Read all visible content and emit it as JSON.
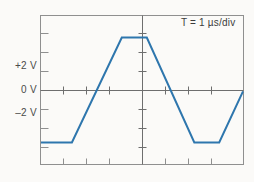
{
  "figure": {
    "background_color": "#fbfaf8",
    "frame_color": "#8c8c8c",
    "axis_color": "#6e6e6e",
    "trace_color": "#2e76ad",
    "label_color": "#4a4a4a"
  },
  "labels": {
    "y_plus2": "+2 V",
    "y_zero": "0 V",
    "y_minus2": "–2 V",
    "timebase": "T = 1 µs/div"
  },
  "chart_data": {
    "type": "line",
    "title": "",
    "subtitle": "",
    "xlabel": "",
    "ylabel": "",
    "annotations": [
      "T = 1 µs/div"
    ],
    "grid": false,
    "legend": "none",
    "x_unit": "µs",
    "y_unit": "V",
    "xlim": [
      -4.25,
      4.25
    ],
    "ylim": [
      -3.95,
      3.95
    ],
    "x_tick_interval": 1,
    "y_tick_interval": 1,
    "x_ticks": [
      -4,
      -3,
      -2,
      -1,
      0,
      1,
      2,
      3,
      4
    ],
    "y_ticks": [
      -3,
      -2,
      -1,
      0,
      1,
      2,
      3
    ],
    "y_tick_labels": [
      {
        "value": 2,
        "label": "+2 V"
      },
      {
        "value": 0,
        "label": "0 V"
      },
      {
        "value": -2,
        "label": "–2 V"
      }
    ],
    "series": [
      {
        "name": "trapezoidal-waveform",
        "color": "#2e76ad",
        "line_width": 2,
        "x": [
          -4.25,
          -2.95,
          -0.85,
          0.2,
          2.2,
          3.25,
          5.3,
          6.35,
          8.45
        ],
        "y": [
          -2.8,
          -2.8,
          2.8,
          2.8,
          -2.8,
          -2.8,
          2.8,
          2.8,
          -2.8
        ],
        "points": [
          {
            "x": -4.25,
            "y": -2.8
          },
          {
            "x": -2.95,
            "y": -2.8
          },
          {
            "x": -0.85,
            "y": 2.8
          },
          {
            "x": 0.2,
            "y": 2.8
          },
          {
            "x": 2.2,
            "y": -2.8
          },
          {
            "x": 3.25,
            "y": -2.8
          },
          {
            "x": 4.25,
            "y": 2.0
          }
        ],
        "description": "Trapezoidal wave, amplitude ±2.8 V, period 4 µs"
      }
    ]
  }
}
